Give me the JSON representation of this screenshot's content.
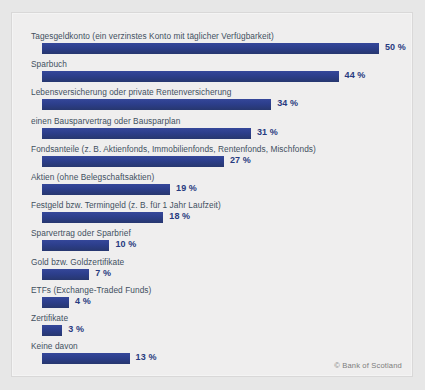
{
  "chart_data": {
    "type": "bar",
    "orientation": "horizontal",
    "title": "",
    "subtitle": "",
    "xlabel": "",
    "ylabel": "",
    "xlim": [
      0,
      50
    ],
    "grid": false,
    "legend": null,
    "value_suffix": "%",
    "categories": [
      "Tagesgeldkonto (ein verzinstes Konto mit täglicher Verfügbarkeit)",
      "Sparbuch",
      "Lebensversicherung oder private Rentenversicherung",
      "einen Bausparvertrag oder Bausparplan",
      "Fondsanteile (z. B. Aktienfonds, Immobilienfonds, Rentenfonds, Mischfonds)",
      "Aktien (ohne Belegschaftsaktien)",
      "Festgeld bzw. Termingeld (z. B. für 1 Jahr Laufzeit)",
      "Sparvertrag oder Sparbrief",
      "Gold bzw. Goldzertifikate",
      "ETFs (Exchange-Traded Funds)",
      "Zertifikate",
      "Keine davon"
    ],
    "values": [
      50,
      44,
      34,
      31,
      27,
      19,
      18,
      10,
      7,
      4,
      3,
      13
    ],
    "value_labels": [
      "50 %",
      "44 %",
      "34 %",
      "31 %",
      "27 %",
      "19 %",
      "18 %",
      "10 %",
      "7 %",
      "4 %",
      "3 %",
      "13 %"
    ]
  },
  "colors": {
    "bar": "#2d3f8c",
    "label_text": "#42505f",
    "value_text": "#273a80",
    "panel_background": "#efeeee",
    "page_background": "#e7e7e7",
    "credit_text": "#7d7d7d"
  },
  "credit": "© Bank of Scotland"
}
